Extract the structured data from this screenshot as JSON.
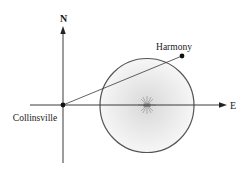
{
  "diagram": {
    "axes": {
      "north_label": "N",
      "east_label": "E"
    },
    "points": {
      "origin": {
        "label": "Collinsville"
      },
      "target": {
        "label": "Harmony"
      }
    },
    "circle": {
      "description": "shaded circular region centered on the east axis with a star-burst at its center"
    },
    "colors": {
      "line": "#3a3a3a",
      "circle_stroke": "#555555",
      "circle_fill_center": "#dcdcdc",
      "circle_fill_edge": "#f4f4f4",
      "star": "#8a8a8a"
    }
  }
}
